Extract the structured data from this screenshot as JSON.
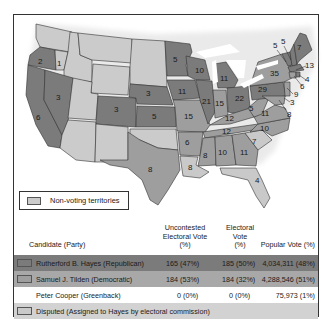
{
  "colors": {
    "republican": "#7b7b7b",
    "democratic": "#9e9e9e",
    "disputed": "#c9c9c9",
    "territory": "#cbcbcb",
    "border": "#333333"
  },
  "map": {
    "states": [
      {
        "abbr": "OR",
        "votes": "2",
        "party": "republican"
      },
      {
        "abbr": "OR-disputed",
        "votes": "1",
        "party": "disputed"
      },
      {
        "abbr": "CA",
        "votes": "6",
        "party": "republican"
      },
      {
        "abbr": "NV",
        "votes": "3",
        "party": "republican"
      },
      {
        "abbr": "CO",
        "votes": "3",
        "party": "republican"
      },
      {
        "abbr": "NE",
        "votes": "3",
        "party": "republican"
      },
      {
        "abbr": "KS",
        "votes": "5",
        "party": "republican"
      },
      {
        "abbr": "TX",
        "votes": "8",
        "party": "democratic"
      },
      {
        "abbr": "MN",
        "votes": "5",
        "party": "republican"
      },
      {
        "abbr": "IA",
        "votes": "11",
        "party": "republican"
      },
      {
        "abbr": "MO",
        "votes": "15",
        "party": "democratic"
      },
      {
        "abbr": "AR",
        "votes": "6",
        "party": "democratic"
      },
      {
        "abbr": "LA",
        "votes": "8",
        "party": "disputed"
      },
      {
        "abbr": "WI",
        "votes": "10",
        "party": "republican"
      },
      {
        "abbr": "IL",
        "votes": "21",
        "party": "republican"
      },
      {
        "abbr": "MI",
        "votes": "11",
        "party": "republican"
      },
      {
        "abbr": "IN",
        "votes": "15",
        "party": "democratic"
      },
      {
        "abbr": "OH",
        "votes": "22",
        "party": "republican"
      },
      {
        "abbr": "KY",
        "votes": "12",
        "party": "democratic"
      },
      {
        "abbr": "TN",
        "votes": "12",
        "party": "democratic"
      },
      {
        "abbr": "MS",
        "votes": "8",
        "party": "democratic"
      },
      {
        "abbr": "AL",
        "votes": "10",
        "party": "democratic"
      },
      {
        "abbr": "GA",
        "votes": "11",
        "party": "democratic"
      },
      {
        "abbr": "FL",
        "votes": "4",
        "party": "disputed"
      },
      {
        "abbr": "SC",
        "votes": "7",
        "party": "disputed"
      },
      {
        "abbr": "NC",
        "votes": "10",
        "party": "democratic"
      },
      {
        "abbr": "VA",
        "votes": "11",
        "party": "democratic"
      },
      {
        "abbr": "WV",
        "votes": "5",
        "party": "democratic"
      },
      {
        "abbr": "PA",
        "votes": "29",
        "party": "republican"
      },
      {
        "abbr": "NY",
        "votes": "35",
        "party": "democratic"
      },
      {
        "abbr": "VT",
        "votes": "5",
        "party": "republican"
      },
      {
        "abbr": "NH",
        "votes": "5",
        "party": "republican"
      },
      {
        "abbr": "ME",
        "votes": "7",
        "party": "republican"
      },
      {
        "abbr": "MA",
        "votes": "13",
        "party": "republican"
      },
      {
        "abbr": "RI",
        "votes": "4",
        "party": "republican"
      },
      {
        "abbr": "CT",
        "votes": "6",
        "party": "democratic"
      },
      {
        "abbr": "NJ",
        "votes": "9",
        "party": "democratic"
      },
      {
        "abbr": "DE",
        "votes": "3",
        "party": "democratic"
      },
      {
        "abbr": "MD",
        "votes": "8",
        "party": "democratic"
      }
    ]
  },
  "legend": {
    "territories_label": "Non-voting territories"
  },
  "table": {
    "headers": {
      "candidate": "Candidate (Party)",
      "uncontested": [
        "Uncontested",
        "Electoral Vote",
        "(%)"
      ],
      "electoral": [
        "Electoral",
        "Vote",
        "(%)"
      ],
      "popular": "Popular Vote (%)"
    },
    "rows": [
      {
        "candidate": "Rutherford B. Hayes (Republican)",
        "uncontested": "165 (47%)",
        "electoral": "185 (50%)",
        "popular": "4,034,311 (48%)"
      },
      {
        "candidate": "Samuel J. Tilden (Democratic)",
        "uncontested": "184 (53%)",
        "electoral": "184 (32%)",
        "popular": "4,288,546 (51%)"
      },
      {
        "candidate": "Peter Cooper (Greenback)",
        "uncontested": "0 (0%)",
        "electoral": "0 (0%)",
        "popular": "75,973 (1%)"
      }
    ],
    "disputed_label": "Disputed (Assigned to Hayes by electoral commission)"
  }
}
